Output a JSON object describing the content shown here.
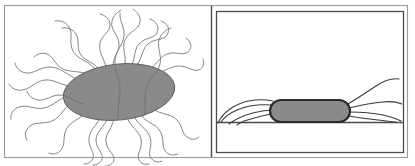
{
  "figure": {
    "canvas": {
      "width": 415,
      "height": 166,
      "background": "#ffffff"
    },
    "colors": {
      "cell_fill": "#8a8a8a",
      "cell_outline_left": "#585858",
      "cell_outline_right": "#2b2b2b",
      "flagella_light": "#6e6e6e",
      "flagella_dark": "#3a3a3a",
      "surface_line": "#4a4a4a",
      "outer_frame": "#9a9a9a",
      "inner_frame": "#4a4a4a"
    },
    "outer_frame": {
      "x": 4,
      "y": 5,
      "width": 404,
      "height": 153
    },
    "divider": {
      "x": 211,
      "y1": 5,
      "y2": 158
    },
    "panels": [
      {
        "id": "left-panel",
        "label": "",
        "caption": "",
        "description": "Free-swimming bacterium with peritrichous wavy flagella radiating outward in all directions",
        "bounds": {
          "x": 4,
          "y": 5,
          "width": 207,
          "height": 153
        },
        "has_inner_frame": false,
        "has_surface_line": false,
        "cell": {
          "shape": "ellipse",
          "cx": 119,
          "cy": 92,
          "rx": 56,
          "ry": 28,
          "rotation_deg": -6,
          "fill": "#8a8a8a"
        },
        "flagella_count": 22,
        "flagella_style": "wavy-sinusoidal"
      },
      {
        "id": "right-panel",
        "label": "",
        "caption": "",
        "description": "Surface-attached rod-shaped bacterium on a horizontal substrate with flagella swept back",
        "bounds": {
          "x": 216,
          "y": 11,
          "width": 188,
          "height": 142
        },
        "has_inner_frame": true,
        "inner_frame": {
          "x": 216,
          "y": 11,
          "width": 188,
          "height": 142
        },
        "has_surface_line": true,
        "surface_line": {
          "x1": 217,
          "x2": 404,
          "y": 122
        },
        "cell": {
          "shape": "rod",
          "x": 270,
          "y": 100,
          "width": 80,
          "height": 22,
          "corner_radius": 11,
          "fill": "#8a8a8a"
        },
        "flagella_count": 8,
        "flagella_style": "smooth-swept"
      }
    ]
  }
}
